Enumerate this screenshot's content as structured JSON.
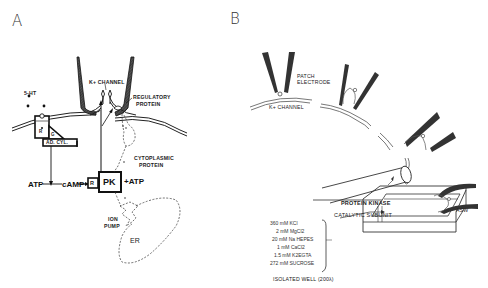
{
  "panels": {
    "a": {
      "letter": "A",
      "labels": {
        "serotonin": "5-HT",
        "receptor": "R",
        "g_protein": "G",
        "adenylyl_cyclase": "AD. CYL.",
        "k_channel": "K+ CHANNEL",
        "regulatory_protein_1": "REGULATORY",
        "regulatory_protein_2": "PROTEIN",
        "cytoplasmic_protein_1": "CYTOPLASMIC",
        "cytoplasmic_protein_2": "PROTEIN",
        "atp_left": "ATP",
        "camp": "cAMP",
        "regulatory_subunit": "R",
        "protein_kinase": "PK",
        "atp_right": "+ATP",
        "ion_pump_1": "ION",
        "ion_pump_2": "PUMP",
        "er": "ER"
      }
    },
    "b": {
      "letter": "B",
      "labels": {
        "patch_electrode_1": "PATCH",
        "patch_electrode_2": "ELECTRODE",
        "k_channel": "K+ CHANNEL",
        "protein_kinase": "PROTEIN KINASE",
        "catalytic_subunit": "CATALYTIC SUBUNIT",
        "asw": "ASW",
        "isolated_well": "ISOLATED WELL (200λ)"
      },
      "solution": [
        "360 mM KCl",
        "2 mM MgCl2",
        "20 mM Na HEPES",
        "1 mM CaCl2",
        "1.5 mM K2EGTA",
        "272 mM SUCROSE"
      ]
    }
  }
}
